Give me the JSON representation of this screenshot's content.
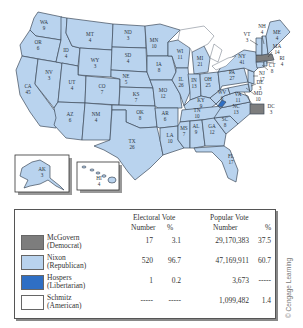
{
  "map": {
    "title": "1972 Presidential Election",
    "states": [
      {
        "abbr": "WA",
        "ev": "9",
        "winner": "Nixon"
      },
      {
        "abbr": "OR",
        "ev": "6",
        "winner": "Nixon"
      },
      {
        "abbr": "CA",
        "ev": "45",
        "winner": "Nixon"
      },
      {
        "abbr": "NV",
        "ev": "3",
        "winner": "Nixon"
      },
      {
        "abbr": "ID",
        "ev": "4",
        "winner": "Nixon"
      },
      {
        "abbr": "MT",
        "ev": "4",
        "winner": "Nixon"
      },
      {
        "abbr": "WY",
        "ev": "3",
        "winner": "Nixon"
      },
      {
        "abbr": "UT",
        "ev": "4",
        "winner": "Nixon"
      },
      {
        "abbr": "AZ",
        "ev": "6",
        "winner": "Nixon"
      },
      {
        "abbr": "CO",
        "ev": "7",
        "winner": "Nixon"
      },
      {
        "abbr": "NM",
        "ev": "4",
        "winner": "Nixon"
      },
      {
        "abbr": "ND",
        "ev": "3",
        "winner": "Nixon"
      },
      {
        "abbr": "SD",
        "ev": "4",
        "winner": "Nixon"
      },
      {
        "abbr": "NE",
        "ev": "5",
        "winner": "Nixon"
      },
      {
        "abbr": "KS",
        "ev": "7",
        "winner": "Nixon"
      },
      {
        "abbr": "OK",
        "ev": "8",
        "winner": "Nixon"
      },
      {
        "abbr": "TX",
        "ev": "26",
        "winner": "Nixon"
      },
      {
        "abbr": "MN",
        "ev": "10",
        "winner": "Nixon"
      },
      {
        "abbr": "IA",
        "ev": "8",
        "winner": "Nixon"
      },
      {
        "abbr": "MO",
        "ev": "12",
        "winner": "Nixon"
      },
      {
        "abbr": "AR",
        "ev": "6",
        "winner": "Nixon"
      },
      {
        "abbr": "LA",
        "ev": "10",
        "winner": "Nixon"
      },
      {
        "abbr": "WI",
        "ev": "11",
        "winner": "Nixon"
      },
      {
        "abbr": "IL",
        "ev": "26",
        "winner": "Nixon"
      },
      {
        "abbr": "MI",
        "ev": "21",
        "winner": "Nixon"
      },
      {
        "abbr": "IN",
        "ev": "13",
        "winner": "Nixon"
      },
      {
        "abbr": "OH",
        "ev": "25",
        "winner": "Nixon"
      },
      {
        "abbr": "KY",
        "ev": "9",
        "winner": "Nixon"
      },
      {
        "abbr": "TN",
        "ev": "10",
        "winner": "Nixon"
      },
      {
        "abbr": "MS",
        "ev": "7",
        "winner": "Nixon"
      },
      {
        "abbr": "AL",
        "ev": "9",
        "winner": "Nixon"
      },
      {
        "abbr": "GA",
        "ev": "12",
        "winner": "Nixon"
      },
      {
        "abbr": "FL",
        "ev": "17",
        "winner": "Nixon"
      },
      {
        "abbr": "SC",
        "ev": "8",
        "winner": "Nixon"
      },
      {
        "abbr": "NC",
        "ev": "13",
        "winner": "Nixon"
      },
      {
        "abbr": "VA",
        "ev": "11",
        "winner": "Nixon (1 Hospers)"
      },
      {
        "abbr": "WV",
        "ev": "6",
        "winner": "Nixon"
      },
      {
        "abbr": "PA",
        "ev": "27",
        "winner": "Nixon"
      },
      {
        "abbr": "NY",
        "ev": "41",
        "winner": "Nixon"
      },
      {
        "abbr": "VT",
        "ev": "3",
        "winner": "Nixon"
      },
      {
        "abbr": "NH",
        "ev": "4",
        "winner": "Nixon"
      },
      {
        "abbr": "ME",
        "ev": "4",
        "winner": "Nixon"
      },
      {
        "abbr": "MA",
        "ev": "14",
        "winner": "McGovern"
      },
      {
        "abbr": "RI",
        "ev": "4",
        "winner": "Nixon"
      },
      {
        "abbr": "CT",
        "ev": "8",
        "winner": "Nixon"
      },
      {
        "abbr": "NJ",
        "ev": "17",
        "winner": "Nixon"
      },
      {
        "abbr": "DE",
        "ev": "3",
        "winner": "Nixon"
      },
      {
        "abbr": "MD",
        "ev": "10",
        "winner": "Nixon"
      },
      {
        "abbr": "DC",
        "ev": "3",
        "winner": "McGovern"
      },
      {
        "abbr": "AK",
        "ev": "3",
        "winner": "Nixon"
      },
      {
        "abbr": "HI",
        "ev": "4",
        "winner": "Nixon"
      }
    ]
  },
  "legend": {
    "headers": {
      "electoral": "Electoral Vote",
      "popular": "Popular Vote",
      "number": "Number",
      "percent": "%"
    },
    "rows": [
      {
        "name": "McGovern",
        "party": "(Democrat)",
        "color": "#7d7d7d",
        "ev_number": "17",
        "ev_pct": "3.1",
        "pop_number": "29,170,383",
        "pop_pct": "37.5"
      },
      {
        "name": "Nixon",
        "party": "(Republican)",
        "color": "#b9d3ee",
        "ev_number": "520",
        "ev_pct": "96.7",
        "pop_number": "47,169,911",
        "pop_pct": "60.7"
      },
      {
        "name": "Hospers",
        "party": "(Libertarian)",
        "color": "#2f6fc4",
        "ev_number": "1",
        "ev_pct": "0.2",
        "pop_number": "3,673",
        "pop_pct": "-----"
      },
      {
        "name": "Schmitz",
        "party": "(American)",
        "color": "#ffffff",
        "ev_number": "-----",
        "ev_pct": "-----",
        "pop_number": "1,099,482",
        "pop_pct": "1.4"
      }
    ]
  },
  "credit": "© Cengage Learning"
}
